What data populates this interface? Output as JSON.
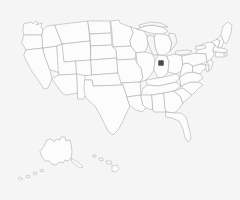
{
  "figure": {
    "title": "Map of the United States",
    "subtitle": "State outline map with single location marker",
    "background_color": "#f6f6f6",
    "outline_color": "#a9a9a9",
    "fill_color": "#fcfcfc",
    "marker_color": "#4a4a4a",
    "projection": "Albers USA (Alaska and Hawaii inset)",
    "width": 240,
    "height": 200
  },
  "marker": {
    "label": "Indiana",
    "shape": "square",
    "x": 161,
    "y": 63,
    "size": 5,
    "color": "#4a4a4a",
    "region": "Northern Indiana, south of Lake Michigan"
  },
  "regions": {
    "contiguous_label": "Contiguous United States",
    "alaska_label": "Alaska",
    "hawaii_label": "Hawaii",
    "great_lakes_label": "Great Lakes"
  },
  "map_data": {
    "type": "choropleth-outline",
    "highlighted": [
      "Indiana"
    ],
    "states": [
      "Alabama",
      "Alaska",
      "Arizona",
      "Arkansas",
      "California",
      "Colorado",
      "Connecticut",
      "Delaware",
      "Florida",
      "Georgia",
      "Hawaii",
      "Idaho",
      "Illinois",
      "Indiana",
      "Iowa",
      "Kansas",
      "Kentucky",
      "Louisiana",
      "Maine",
      "Maryland",
      "Massachusetts",
      "Michigan",
      "Minnesota",
      "Mississippi",
      "Missouri",
      "Montana",
      "Nebraska",
      "Nevada",
      "New Hampshire",
      "New Jersey",
      "New Mexico",
      "New York",
      "North Carolina",
      "North Dakota",
      "Ohio",
      "Oklahoma",
      "Oregon",
      "Pennsylvania",
      "Rhode Island",
      "South Carolina",
      "South Dakota",
      "Tennessee",
      "Texas",
      "Utah",
      "Vermont",
      "Virginia",
      "Washington",
      "West Virginia",
      "Wisconsin",
      "Wyoming"
    ],
    "state_count": 50,
    "lakes": [
      "Lake Michigan",
      "Lake Superior",
      "Lake Huron",
      "Lake Erie",
      "Lake Ontario"
    ]
  }
}
